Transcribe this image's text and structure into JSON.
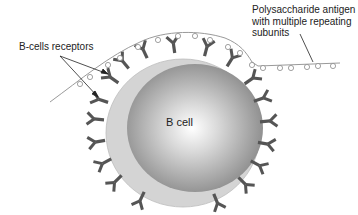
{
  "diagram": {
    "labels": {
      "receptors": "B-cells receptors",
      "antigen_line1": "Polysaccharide antigen",
      "antigen_line2": "with multiple repeating",
      "antigen_line3": "subunits",
      "cell": "B cell"
    },
    "colors": {
      "outer_cell": "#d2d2d2",
      "inner_sphere_center": "#ffffff",
      "inner_sphere_edge": "#8a8a8a",
      "receptor": "#555555",
      "antigen_line": "#9a9a9a",
      "pointer_line": "#222222"
    }
  }
}
